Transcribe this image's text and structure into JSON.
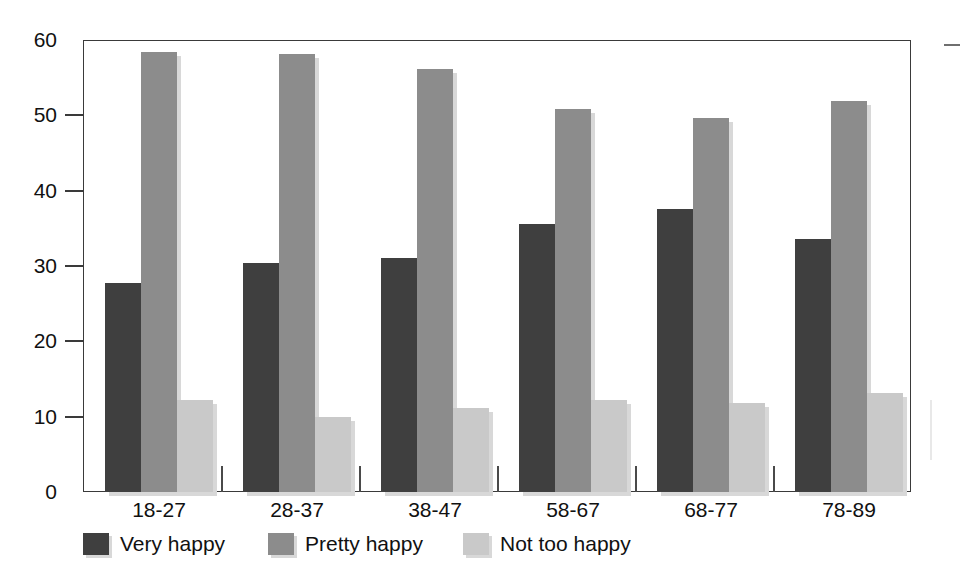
{
  "chart_data": {
    "type": "bar",
    "title": "",
    "xlabel": "",
    "ylabel": "",
    "categories": [
      "18-27",
      "28-37",
      "38-47",
      "58-67",
      "68-77",
      "78-89"
    ],
    "series": [
      {
        "name": "Very happy",
        "color": "#3f3f3f",
        "values": [
          27.7,
          30.4,
          31.1,
          35.6,
          37.6,
          33.6
        ]
      },
      {
        "name": "Pretty happy",
        "color": "#8c8c8c",
        "values": [
          58.4,
          58.2,
          56.2,
          50.8,
          49.6,
          51.9
        ]
      },
      {
        "name": "Not too happy",
        "color": "#c9c9c9",
        "values": [
          12.2,
          9.9,
          11.2,
          12.2,
          11.8,
          13.2
        ]
      }
    ],
    "ylim": [
      0,
      60
    ],
    "yticks": [
      "0",
      "10",
      "20",
      "30",
      "40",
      "50",
      "60"
    ],
    "ytick_values": [
      0,
      10,
      20,
      30,
      40,
      50,
      60
    ],
    "grid": false,
    "legend_position": "bottom-left"
  },
  "legend": {
    "items": [
      {
        "label": "Very happy",
        "swatch": "legend-swatch-very-happy"
      },
      {
        "label": "Pretty happy",
        "swatch": "legend-swatch-pretty-happy"
      },
      {
        "label": "Not too happy",
        "swatch": "legend-swatch-not-too-happy"
      }
    ]
  },
  "colors": {
    "very_happy": "#3f3f3f",
    "pretty_happy": "#8c8c8c",
    "not_too_happy": "#c9c9c9",
    "axis": "#3a3a3a",
    "shadow": "#d8d8d8",
    "background": "#ffffff"
  }
}
